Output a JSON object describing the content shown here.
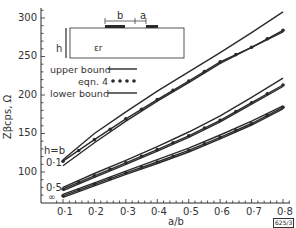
{
  "chart_data": {
    "type": "line",
    "title": "",
    "xlabel": "a/b",
    "ylabel": "Z_{βcps}, Ω",
    "xlim": [
      0.08,
      0.82
    ],
    "ylim": [
      68,
      312
    ],
    "x_ticks": [
      "0.1",
      "0.2",
      "0.3",
      "0.4",
      "0.5",
      "0.6",
      "0.7",
      "0.8"
    ],
    "y_ticks": [
      "100",
      "150",
      "200",
      "250",
      "300"
    ],
    "grid": false,
    "legend": {
      "position": "upper-left",
      "entries": [
        {
          "label": "upper bound",
          "style": "line"
        },
        {
          "label": "eqn. 4",
          "style": "dots"
        },
        {
          "label": "lower bound",
          "style": "line"
        }
      ]
    },
    "annotations": [
      "h=b",
      "0.1",
      "0.5",
      "∞",
      "625/3",
      "ε_r",
      "h",
      "b",
      "a"
    ],
    "x": [
      0.1,
      0.2,
      0.3,
      0.4,
      0.5,
      0.6,
      0.7,
      0.8
    ],
    "series": [
      {
        "name": "h/b=0.1 upper bound",
        "values": [
          116,
          150,
          178,
          205,
          230,
          255,
          281,
          308
        ]
      },
      {
        "name": "h/b=0.1 eqn. 4",
        "values": [
          114,
          142,
          169,
          194,
          218,
          243,
          262,
          284
        ]
      },
      {
        "name": "h/b=0.1 lower bound",
        "values": [
          108,
          138,
          166,
          192,
          216,
          241,
          262,
          282
        ]
      },
      {
        "name": "h/b=0.5 upper bound",
        "values": [
          80,
          98,
          115,
          133,
          152,
          173,
          197,
          222
        ]
      },
      {
        "name": "h/b=0.5 eqn. 4",
        "values": [
          78,
          95,
          112,
          129,
          147,
          167,
          190,
          213
        ]
      },
      {
        "name": "h/b=0.5 lower bound",
        "values": [
          76,
          93,
          110,
          127,
          145,
          165,
          188,
          211
        ]
      },
      {
        "name": "h/b=∞ upper bound",
        "values": [
          71,
          86,
          101,
          116,
          131,
          148,
          166,
          186
        ]
      },
      {
        "name": "h/b=∞ eqn. 4",
        "values": [
          69,
          84,
          99,
          113,
          128,
          145,
          163,
          184
        ]
      },
      {
        "name": "h/b=∞ lower bound",
        "values": [
          67,
          82,
          97,
          111,
          126,
          143,
          161,
          182
        ]
      }
    ]
  },
  "labels": {
    "xlabel": "a/b",
    "ylabel": "Zβcps, Ω",
    "h_eq_b": "h=b",
    "curve_01": "0·1",
    "curve_05": "0·5",
    "curve_inf": "∞",
    "fig_ref": "625/3",
    "inset_er": "εr",
    "inset_h": "h",
    "inset_b": "b",
    "inset_a": "a",
    "legend_upper": "upper bound",
    "legend_eqn": "eqn. 4",
    "legend_lower": "lower bound",
    "xticks": [
      "0·1",
      "0·2",
      "0·3",
      "0·4",
      "0·5",
      "0·6",
      "0·7",
      "0·8"
    ],
    "yticks": [
      "300",
      "250",
      "200",
      "150",
      "100"
    ]
  },
  "colors": {
    "ink": "#2a2a2a",
    "background": "#ffffff"
  }
}
